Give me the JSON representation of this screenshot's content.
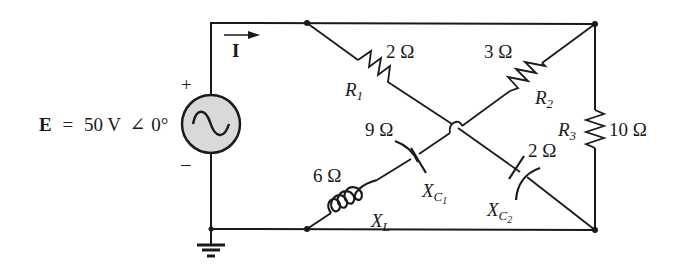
{
  "diagram": {
    "type": "AC circuit schematic",
    "source": {
      "symbol": "E",
      "equals": "=",
      "value": "50 V",
      "angle_symbol": "∠",
      "phase": "0°",
      "plus": "+",
      "minus": "–",
      "fill_color": "#d9d9d9"
    },
    "current": {
      "symbol": "I"
    },
    "components": {
      "R1": {
        "name": "R",
        "sub": "1",
        "value": "2 Ω"
      },
      "R2": {
        "name": "R",
        "sub": "2",
        "value": "3 Ω"
      },
      "R3": {
        "name": "R",
        "sub": "3",
        "value": "10 Ω"
      },
      "XC1": {
        "name": "X",
        "sub": "C",
        "subsub": "1",
        "value": "9 Ω"
      },
      "XC2": {
        "name": "X",
        "sub": "C",
        "subsub": "2",
        "value": "2 Ω"
      },
      "XL": {
        "name": "X",
        "sub": "L",
        "value": "6 Ω"
      }
    },
    "ground": "ground-symbol"
  }
}
